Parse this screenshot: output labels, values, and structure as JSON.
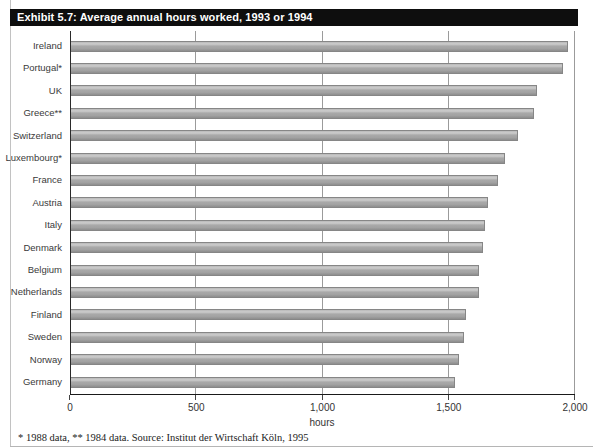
{
  "title": "Exhibit 5.7: Average annual hours worked, 1993 or 1994",
  "footnote": "* 1988 data, ** 1984 data. Source: Institut der Wirtschaft Köln, 1995",
  "colors": {
    "title_bar_bg": "#0e0e0e",
    "title_text": "#ffffff",
    "bar_fill": "#a5a5a5",
    "bar_border": "#868686",
    "gridline": "#9b9b9b",
    "axis": "#1a1a1a",
    "frame": "#c2c2c2"
  },
  "chart_data": {
    "type": "bar",
    "orientation": "horizontal",
    "title": "Exhibit 5.7: Average annual hours worked, 1993 or 1994",
    "categories": [
      "Ireland",
      "Portugal*",
      "UK",
      "Greece**",
      "Switzerland",
      "Luxembourg*",
      "France",
      "Austria",
      "Italy",
      "Denmark",
      "Belgium",
      "Netherlands",
      "Finland",
      "Sweden",
      "Norway",
      "Germany"
    ],
    "values": [
      1970,
      1950,
      1845,
      1835,
      1770,
      1720,
      1690,
      1650,
      1640,
      1630,
      1615,
      1615,
      1565,
      1555,
      1535,
      1520
    ],
    "xlabel": "hours",
    "ylabel": "",
    "xlim": [
      0,
      2000
    ],
    "xticks": [
      0,
      500,
      1000,
      1500,
      2000
    ],
    "xtick_labels": [
      "0",
      "500",
      "1,000",
      "1,500",
      "2,000"
    ],
    "grid": true,
    "legend": null,
    "annotations": [
      "* 1988 data",
      "** 1984 data",
      "Source: Institut der Wirtschaft Köln, 1995"
    ]
  }
}
